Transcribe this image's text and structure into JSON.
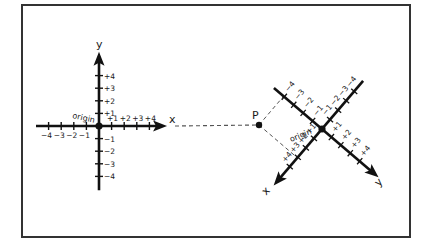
{
  "frame": {
    "x": 22,
    "y": 5,
    "w": 388,
    "h": 232,
    "stroke": "#333333"
  },
  "colors": {
    "ink": "#111111",
    "dash": "#555555"
  },
  "left_system": {
    "origin": [
      99,
      126
    ],
    "unit": 12.6,
    "x_axis": {
      "name": "x",
      "from": -5,
      "to": 5.4
    },
    "y_axis": {
      "name": "y",
      "from": -5.1,
      "to": 5.9
    },
    "origin_label": "origin",
    "x_ticks": [
      {
        "v": -4,
        "label": "−4"
      },
      {
        "v": -3,
        "label": "−3"
      },
      {
        "v": -2,
        "label": "−2"
      },
      {
        "v": -1,
        "label": "−1"
      },
      {
        "v": 1,
        "label": "+1"
      },
      {
        "v": 2,
        "label": "+2"
      },
      {
        "v": 3,
        "label": "+3"
      },
      {
        "v": 4,
        "label": "+4"
      }
    ],
    "y_ticks": [
      {
        "v": 4,
        "label": "+4"
      },
      {
        "v": 3,
        "label": "+3"
      },
      {
        "v": 2,
        "label": "+2"
      },
      {
        "v": 1,
        "label": "+1"
      },
      {
        "v": -1,
        "label": "−1"
      },
      {
        "v": -2,
        "label": "−2"
      },
      {
        "v": -3,
        "label": "−3"
      },
      {
        "v": -4,
        "label": "−4"
      }
    ]
  },
  "right_system": {
    "origin": [
      322,
      129
    ],
    "unit": 12.4,
    "x_dir": [
      -0.65,
      0.76
    ],
    "y_dir": [
      0.76,
      0.65
    ],
    "x_axis": {
      "name": "x",
      "from": -5.1,
      "to": 6.0
    },
    "y_axis": {
      "name": "y",
      "from": -5.1,
      "to": 6.0
    },
    "origin_label": "origin",
    "x_ticks": [
      {
        "v": -4,
        "label": "−4"
      },
      {
        "v": -3,
        "label": "−3"
      },
      {
        "v": -2,
        "label": "−2"
      },
      {
        "v": -1,
        "label": "−1"
      },
      {
        "v": 1,
        "label": "+1"
      },
      {
        "v": 2,
        "label": "+2"
      },
      {
        "v": 3,
        "label": "+3"
      },
      {
        "v": 4,
        "label": "+4"
      }
    ],
    "y_ticks": [
      {
        "v": -4,
        "label": "−4"
      },
      {
        "v": -3,
        "label": "−3"
      },
      {
        "v": -2,
        "label": "−2"
      },
      {
        "v": -1,
        "label": "−1"
      },
      {
        "v": 1,
        "label": "+1"
      },
      {
        "v": 2,
        "label": "+2"
      },
      {
        "v": 3,
        "label": "+3"
      },
      {
        "v": 4,
        "label": "+4"
      }
    ]
  },
  "point": {
    "label": "P",
    "pos": [
      259,
      125
    ]
  },
  "projection_line": {
    "from": [
      175,
      126
    ],
    "to": [
      259,
      125
    ]
  }
}
